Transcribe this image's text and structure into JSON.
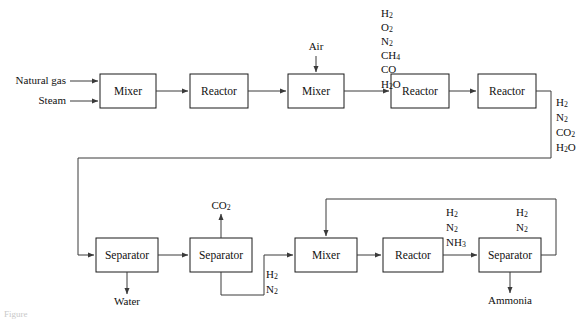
{
  "figure": {
    "caption": "Figure",
    "stroke_color": "#3a3a3a",
    "box_stroke_color": "#1a1a1a",
    "background": "#ffffff"
  },
  "units": {
    "mixer_1": "Mixer",
    "reactor_1": "Reactor",
    "mixer_2": "Mixer",
    "reactor_2": "Reactor",
    "reactor_3": "Reactor",
    "separator_1": "Separator",
    "separator_2": "Separator",
    "mixer_3": "Mixer",
    "reactor_4": "Reactor",
    "separator_3": "Separator"
  },
  "feeds": {
    "natural_gas": "Natural gas",
    "steam": "Steam",
    "air": "Air"
  },
  "products": {
    "water": "Water",
    "carbon_dioxide": {
      "formula": "CO",
      "sub": "2"
    },
    "ammonia": "Ammonia"
  },
  "streams": {
    "reformer_outlet": [
      {
        "formula": "H",
        "sub": "2"
      },
      {
        "formula": "O",
        "sub": "2"
      },
      {
        "formula": "N",
        "sub": "2"
      },
      {
        "formula": "CH",
        "sub": "4"
      },
      {
        "formula": "CO",
        "sub": ""
      },
      {
        "formula": "H",
        "sub": "2",
        "tail": "O"
      }
    ],
    "shift_outlet": [
      {
        "formula": "H",
        "sub": "2"
      },
      {
        "formula": "N",
        "sub": "2"
      },
      {
        "formula": "CO",
        "sub": "2"
      },
      {
        "formula": "H",
        "sub": "2",
        "tail": "O"
      }
    ],
    "syngas_recycle": [
      {
        "formula": "H",
        "sub": "2"
      },
      {
        "formula": "N",
        "sub": "2"
      }
    ],
    "converter_outlet": [
      {
        "formula": "H",
        "sub": "2"
      },
      {
        "formula": "N",
        "sub": "2"
      },
      {
        "formula": "NH",
        "sub": "3"
      }
    ],
    "unreacted_recycle": [
      {
        "formula": "H",
        "sub": "2"
      },
      {
        "formula": "N",
        "sub": "2"
      }
    ]
  }
}
